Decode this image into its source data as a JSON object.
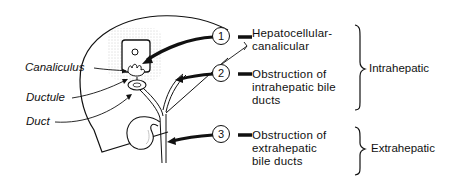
{
  "diagram": {
    "structure_labels": {
      "canaliculus": "Canaliculus",
      "ductule": "Ductule",
      "duct": "Duct"
    },
    "markers": [
      {
        "number": "1",
        "text_line1": "Hepatocellular-",
        "text_line2": "canalicular",
        "text_line3": ""
      },
      {
        "number": "2",
        "text_line1": "Obstruction of",
        "text_line2": "intrahepatic bile",
        "text_line3": "ducts"
      },
      {
        "number": "3",
        "text_line1": "Obstruction of",
        "text_line2": "extrahepatic",
        "text_line3": "bile ducts"
      }
    ],
    "categories": {
      "intrahepatic": "Intrahepatic",
      "extrahepatic": "Extrahepatic"
    },
    "colors": {
      "ink": "#111111",
      "stipple": "#bdbdbd",
      "background": "#ffffff"
    }
  }
}
